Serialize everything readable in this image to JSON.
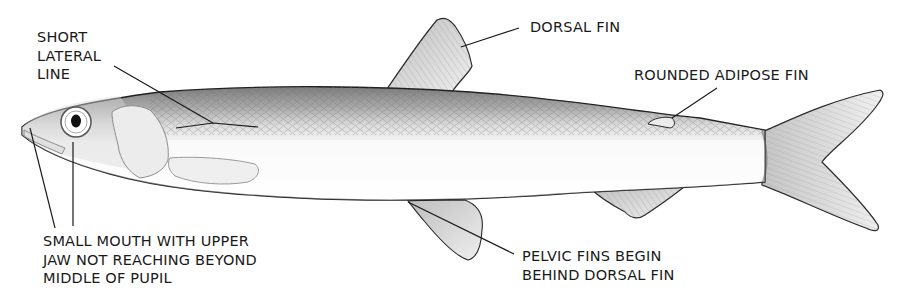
{
  "diagram": {
    "labels": {
      "lateral_line": [
        "SHORT",
        "LATERAL",
        "LINE"
      ],
      "mouth": [
        "SMALL MOUTH WITH UPPER",
        "JAW NOT REACHING BEYOND",
        "MIDDLE OF PUPIL"
      ],
      "dorsal_fin": [
        "DORSAL FIN"
      ],
      "adipose_fin": [
        "ROUNDED ADIPOSE FIN"
      ],
      "pelvic_fins": [
        "PELVIC FINS BEGIN",
        "BEHIND DORSAL FIN"
      ]
    },
    "colors": {
      "line": "#1a1a1a",
      "back_shade": "#8a8a8a",
      "body": "#f4f4f4",
      "fin": "#e6e6e6"
    }
  }
}
